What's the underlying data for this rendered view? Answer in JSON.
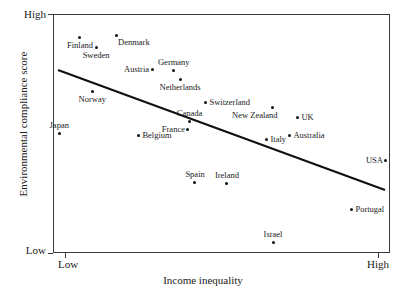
{
  "chart_data": {
    "type": "scatter",
    "title": "",
    "xlabel": "Income inequality",
    "ylabel": "Environmental compliance score",
    "x_ticks": [
      "Low",
      "High"
    ],
    "y_ticks": [
      "High",
      "Low"
    ],
    "xlim": [
      "Low",
      "High"
    ],
    "ylim": [
      "Low",
      "High"
    ],
    "grid": false,
    "legend": "none",
    "marker_color": "#111111",
    "trendline": {
      "present": true,
      "description": "negative linear fit",
      "color": "#111111",
      "x_start_px": 58,
      "y_start_px": 70,
      "x_end_px": 385,
      "y_end_px": 190
    },
    "points": [
      {
        "label": "Finland",
        "x": 0.08,
        "y": 0.9,
        "label_pos": "below"
      },
      {
        "label": "Denmark",
        "x": 0.187,
        "y": 0.908,
        "label_pos": "right-below"
      },
      {
        "label": "Sweden",
        "x": 0.128,
        "y": 0.858,
        "label_pos": "below"
      },
      {
        "label": "Austria",
        "x": 0.294,
        "y": 0.768,
        "label_pos": "left"
      },
      {
        "label": "Germany",
        "x": 0.359,
        "y": 0.762,
        "label_pos": "above"
      },
      {
        "label": "Netherlands",
        "x": 0.377,
        "y": 0.724,
        "label_pos": "below"
      },
      {
        "label": "Norway",
        "x": 0.116,
        "y": 0.674,
        "label_pos": "below"
      },
      {
        "label": "Switzerland",
        "x": 0.454,
        "y": 0.628,
        "label_pos": "right"
      },
      {
        "label": "Canada",
        "x": 0.406,
        "y": 0.552,
        "label_pos": "above"
      },
      {
        "label": "New Zealand",
        "x": 0.65,
        "y": 0.607,
        "label_pos": "below-left"
      },
      {
        "label": "France",
        "x": 0.4,
        "y": 0.515,
        "label_pos": "left"
      },
      {
        "label": "UK",
        "x": 0.727,
        "y": 0.565,
        "label_pos": "right"
      },
      {
        "label": "Japan",
        "x": 0.018,
        "y": 0.502,
        "label_pos": "above"
      },
      {
        "label": "Belgium",
        "x": 0.255,
        "y": 0.49,
        "label_pos": "right"
      },
      {
        "label": "Italy",
        "x": 0.635,
        "y": 0.473,
        "label_pos": "right"
      },
      {
        "label": "Australia",
        "x": 0.703,
        "y": 0.49,
        "label_pos": "right"
      },
      {
        "label": "USA",
        "x": 0.988,
        "y": 0.385,
        "label_pos": "left"
      },
      {
        "label": "Spain",
        "x": 0.421,
        "y": 0.293,
        "label_pos": "above"
      },
      {
        "label": "Ireland",
        "x": 0.516,
        "y": 0.289,
        "label_pos": "above"
      },
      {
        "label": "Portugal",
        "x": 0.887,
        "y": 0.184,
        "label_pos": "right"
      },
      {
        "label": "Israel",
        "x": 0.653,
        "y": 0.042,
        "label_pos": "above"
      }
    ]
  },
  "axes": {
    "y_title": "Environmental compliance score",
    "x_title": "Income inequality",
    "y_high": "High",
    "y_low": "Low",
    "x_low": "Low",
    "x_high": "High"
  }
}
